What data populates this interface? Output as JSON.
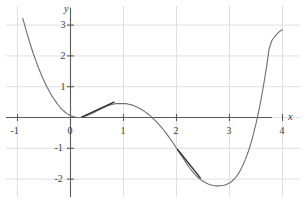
{
  "chart_data": {
    "type": "line",
    "title": "",
    "subtitle": "",
    "xlabel": "x",
    "ylabel": "y",
    "xlim": [
      -1.15,
      4.35
    ],
    "ylim": [
      -2.45,
      3.45
    ],
    "xticks": [
      -1,
      0,
      1,
      2,
      3,
      4
    ],
    "xtick_labels": [
      "-1",
      "0",
      "1",
      "2",
      "3",
      "4"
    ],
    "yticks": [
      -2,
      -1,
      0,
      1,
      2,
      3
    ],
    "ytick_labels": [
      "-2",
      "-1",
      "0",
      "1",
      "2",
      "3"
    ],
    "grid": true,
    "grid_color": "#d8d8d8",
    "axis_color": "#5a5a5a",
    "legend": "none",
    "series": [
      {
        "name": "f(x)",
        "type": "line",
        "color": "#6e6e6e",
        "linewidth": 1.1,
        "x": [
          -0.9,
          -0.85,
          -0.8,
          -0.75,
          -0.7,
          -0.65,
          -0.6,
          -0.55,
          -0.5,
          -0.45,
          -0.4,
          -0.35,
          -0.3,
          -0.25,
          -0.2,
          -0.15,
          -0.1,
          -0.05,
          0.0,
          0.05,
          0.1,
          0.15,
          0.2,
          0.25,
          0.3,
          0.35,
          0.4,
          0.45,
          0.5,
          0.55,
          0.6,
          0.65,
          0.7,
          0.75,
          0.8,
          0.85,
          0.9,
          0.95,
          1.0,
          1.05,
          1.1,
          1.15,
          1.2,
          1.25,
          1.3,
          1.35,
          1.4,
          1.45,
          1.5,
          1.55,
          1.6,
          1.65,
          1.7,
          1.75,
          1.8,
          1.85,
          1.9,
          1.95,
          2.0,
          2.05,
          2.1,
          2.15,
          2.2,
          2.25,
          2.3,
          2.35,
          2.4,
          2.45,
          2.5,
          2.55,
          2.6,
          2.65,
          2.7,
          2.75,
          2.8,
          2.85,
          2.9,
          2.95,
          3.0,
          3.05,
          3.1,
          3.15,
          3.2,
          3.25,
          3.3,
          3.35,
          3.4,
          3.45,
          3.5,
          3.55,
          3.6,
          3.65,
          3.7,
          3.75,
          3.8,
          3.85,
          3.9,
          3.95,
          4.0
        ],
        "y": [
          3.22,
          2.91,
          2.61,
          2.33,
          2.07,
          1.83,
          1.6,
          1.39,
          1.19,
          1.01,
          0.85,
          0.7,
          0.57,
          0.45,
          0.34,
          0.25,
          0.17,
          0.11,
          0.06,
          0.03,
          0.01,
          0.0,
          0.01,
          0.03,
          0.06,
          0.09,
          0.13,
          0.17,
          0.22,
          0.26,
          0.3,
          0.34,
          0.38,
          0.41,
          0.43,
          0.45,
          0.45,
          0.45,
          0.45,
          0.45,
          0.43,
          0.41,
          0.38,
          0.34,
          0.3,
          0.25,
          0.19,
          0.13,
          0.06,
          -0.02,
          -0.1,
          -0.19,
          -0.29,
          -0.39,
          -0.5,
          -0.62,
          -0.74,
          -0.86,
          -1.0,
          -1.13,
          -1.26,
          -1.39,
          -1.52,
          -1.64,
          -1.75,
          -1.85,
          -1.94,
          -2.01,
          -2.07,
          -2.12,
          -2.16,
          -2.19,
          -2.21,
          -2.22,
          -2.22,
          -2.21,
          -2.2,
          -2.17,
          -2.13,
          -2.06,
          -1.98,
          -1.87,
          -1.73,
          -1.56,
          -1.36,
          -1.13,
          -0.86,
          -0.55,
          -0.2,
          0.19,
          0.63,
          1.12,
          1.66,
          2.25,
          2.5,
          2.62,
          2.72,
          2.8,
          2.85
        ]
      },
      {
        "name": "tangent-segment-left",
        "type": "segment",
        "color": "#2b2b2b",
        "linewidth": 1.3,
        "x": [
          0.22,
          0.82
        ],
        "y": [
          0.02,
          0.5
        ]
      },
      {
        "name": "tangent-segment-right",
        "type": "segment",
        "color": "#2b2b2b",
        "linewidth": 1.3,
        "x": [
          2.02,
          2.45
        ],
        "y": [
          -1.04,
          -1.96
        ]
      }
    ],
    "annotations": []
  },
  "axis_labels": {
    "x": "x",
    "y": "y"
  },
  "ticks": {
    "x": [
      {
        "value": -1,
        "label": "-1"
      },
      {
        "value": 0,
        "label": "0"
      },
      {
        "value": 1,
        "label": "1"
      },
      {
        "value": 2,
        "label": "2"
      },
      {
        "value": 3,
        "label": "3"
      },
      {
        "value": 4,
        "label": "4"
      }
    ],
    "y": [
      {
        "value": 3,
        "label": "3"
      },
      {
        "value": 2,
        "label": "2"
      },
      {
        "value": 1,
        "label": "1"
      },
      {
        "value": -1,
        "label": "-1"
      },
      {
        "value": -2,
        "label": "-2"
      }
    ],
    "origin_label": "0"
  },
  "colors": {
    "background": "#ffffff",
    "curve": "#6e6e6e",
    "tangent": "#2b2b2b",
    "axis": "#5a5a5a",
    "grid": "#d8d8d8",
    "text": "#3a3a3a"
  }
}
